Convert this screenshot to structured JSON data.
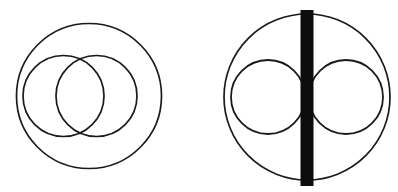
{
  "page": {
    "background_color": "#ffffff",
    "width": 398,
    "height": 192
  },
  "style": {
    "stroke_color": "#1a1a1a",
    "fill_none": "none",
    "thin_stroke_width": 1.6,
    "bar_fill_color": "#0d0d0d"
  },
  "figures": [
    {
      "id": "figure-left",
      "label": "Left figure: outer circle enclosing two overlapping circles",
      "outer_circle": {
        "cx": 89,
        "cy": 96,
        "r": 72.5
      },
      "inner_circles": [
        {
          "id": "left-inner-circle-a",
          "cx": 63.5,
          "cy": 96,
          "r": 40.5
        },
        {
          "id": "left-inner-circle-b",
          "cx": 96.5,
          "cy": 96,
          "r": 40.5
        }
      ],
      "overlap_type": "vesica-piscis",
      "intersection_points": [
        {
          "x": 80,
          "y": 56
        },
        {
          "x": 80,
          "y": 136
        }
      ]
    },
    {
      "id": "figure-right",
      "label": "Right figure: outer circle with thick central vertical bar and two flanking circles",
      "outer_circle": {
        "cx": 307,
        "cy": 97,
        "r": 83
      },
      "inner_circles": [
        {
          "id": "right-inner-circle-a",
          "cx": 268,
          "cy": 97,
          "r": 37
        },
        {
          "id": "right-inner-circle-b",
          "cx": 346,
          "cy": 97,
          "r": 37
        }
      ],
      "center_bar": {
        "x": 300.5,
        "y": 10,
        "width": 13,
        "height": 176
      },
      "overlap_type": "tangent-to-bar"
    }
  ],
  "chart_data": {
    "type": "scatter",
    "xlabel": "",
    "ylabel": "",
    "grid": false,
    "legend_position": "none",
    "xlim": [
      0,
      398
    ],
    "ylim": [
      0,
      192
    ],
    "shapes": [
      {
        "figure": "left",
        "kind": "circle",
        "role": "outer",
        "cx": 89,
        "cy": 96,
        "r": 72.5,
        "filled": false
      },
      {
        "figure": "left",
        "kind": "circle",
        "role": "inner",
        "cx": 63.5,
        "cy": 96,
        "r": 40.5,
        "filled": false
      },
      {
        "figure": "left",
        "kind": "circle",
        "role": "inner",
        "cx": 96.5,
        "cy": 96,
        "r": 40.5,
        "filled": false
      },
      {
        "figure": "right",
        "kind": "circle",
        "role": "outer",
        "cx": 307,
        "cy": 97,
        "r": 83,
        "filled": false
      },
      {
        "figure": "right",
        "kind": "circle",
        "role": "inner",
        "cx": 268,
        "cy": 97,
        "r": 37,
        "filled": false
      },
      {
        "figure": "right",
        "kind": "circle",
        "role": "inner",
        "cx": 346,
        "cy": 97,
        "r": 37,
        "filled": false
      },
      {
        "figure": "right",
        "kind": "rect",
        "role": "bar",
        "x": 300.5,
        "y": 10,
        "width": 13,
        "height": 176,
        "filled": true
      }
    ]
  }
}
